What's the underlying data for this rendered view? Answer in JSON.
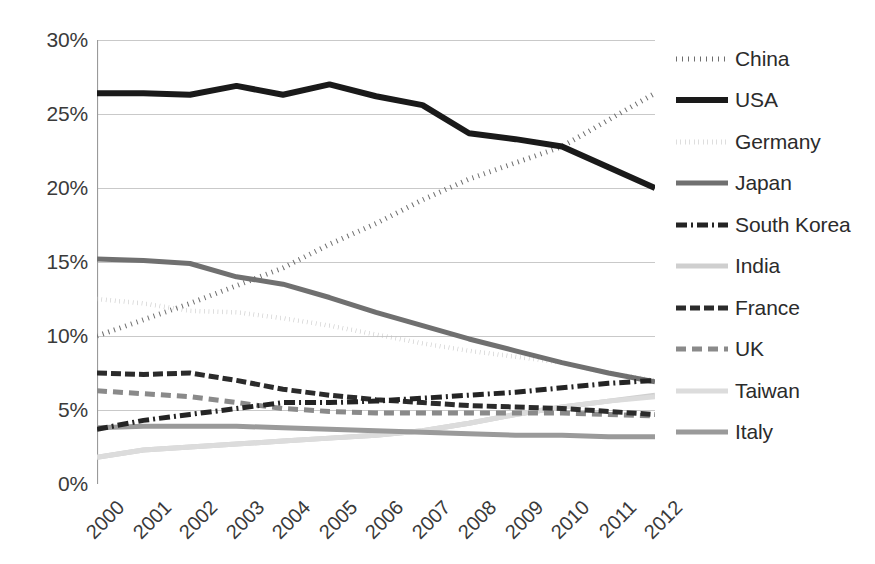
{
  "chart_data": {
    "type": "line",
    "title": "",
    "xlabel": "",
    "ylabel": "",
    "x": [
      "2000",
      "2001",
      "2002",
      "2003",
      "2004",
      "2005",
      "2006",
      "2007",
      "2008",
      "2009",
      "2010",
      "2011",
      "2012"
    ],
    "ylim": [
      0,
      30
    ],
    "ytick_labels": [
      "0%",
      "5%",
      "10%",
      "15%",
      "20%",
      "25%",
      "30%"
    ],
    "ytick_values": [
      0,
      5,
      10,
      15,
      20,
      25,
      30
    ],
    "grid": "horizontal",
    "legend_position": "right",
    "value_suffix": "%",
    "series": [
      {
        "name": "China",
        "style": "dotted",
        "color": "#6e6e6e",
        "width": 5,
        "dash": "1,5",
        "values": [
          10.0,
          11.1,
          12.2,
          13.4,
          14.6,
          16.2,
          17.6,
          19.2,
          20.6,
          21.7,
          22.8,
          24.6,
          26.4
        ]
      },
      {
        "name": "USA",
        "style": "solid",
        "color": "#1a1a1a",
        "width": 6,
        "dash": "",
        "values": [
          26.4,
          26.4,
          26.3,
          26.9,
          26.3,
          27.0,
          26.2,
          25.6,
          23.7,
          23.3,
          22.8,
          21.4,
          20.0
        ]
      },
      {
        "name": "Germany",
        "style": "dotted",
        "color": "#bdbdbd",
        "width": 4.5,
        "dash": "0.5,4",
        "values": [
          12.5,
          12.2,
          11.7,
          11.6,
          11.2,
          10.7,
          10.1,
          9.5,
          9.0,
          8.6,
          8.2,
          7.5,
          7.0
        ]
      },
      {
        "name": "Japan",
        "style": "solid",
        "color": "#707070",
        "width": 5,
        "dash": "",
        "values": [
          15.2,
          15.1,
          14.9,
          14.0,
          13.5,
          12.6,
          11.6,
          10.7,
          9.8,
          9.0,
          8.2,
          7.5,
          6.9
        ]
      },
      {
        "name": "South Korea",
        "style": "dashdot",
        "color": "#242424",
        "width": 5,
        "dash": "11,4,2,4",
        "values": [
          3.7,
          4.3,
          4.7,
          5.1,
          5.5,
          5.5,
          5.6,
          5.8,
          6.0,
          6.2,
          6.5,
          6.8,
          7.0
        ]
      },
      {
        "name": "India",
        "style": "solid",
        "color": "#cfcfcf",
        "width": 5,
        "dash": "",
        "values": [
          1.8,
          2.3,
          2.5,
          2.7,
          2.9,
          3.1,
          3.3,
          3.6,
          4.1,
          4.7,
          5.2,
          5.6,
          6.0
        ]
      },
      {
        "name": "France",
        "style": "dashed",
        "color": "#2b2b2b",
        "width": 5,
        "dash": "10,4",
        "values": [
          7.5,
          7.4,
          7.5,
          7.0,
          6.4,
          6.0,
          5.7,
          5.5,
          5.3,
          5.2,
          5.1,
          4.9,
          4.7
        ]
      },
      {
        "name": "UK",
        "style": "dashed",
        "color": "#8a8a8a",
        "width": 5,
        "dash": "10,6",
        "values": [
          6.3,
          6.1,
          5.9,
          5.5,
          5.1,
          4.9,
          4.8,
          4.8,
          4.8,
          4.8,
          4.8,
          4.7,
          4.6
        ]
      },
      {
        "name": "Taiwan",
        "style": "solid",
        "color": "#dcdcdc",
        "width": 5,
        "dash": "",
        "values": [
          1.8,
          2.3,
          2.5,
          2.7,
          2.9,
          3.1,
          3.3,
          3.6,
          4.1,
          4.7,
          5.2,
          5.6,
          5.9
        ]
      },
      {
        "name": "Italy",
        "style": "solid",
        "color": "#9a9a9a",
        "width": 5,
        "dash": "",
        "values": [
          3.8,
          3.9,
          3.9,
          3.9,
          3.8,
          3.7,
          3.6,
          3.5,
          3.4,
          3.3,
          3.3,
          3.2,
          3.2
        ]
      }
    ]
  },
  "legend": {
    "items": [
      {
        "label": "China"
      },
      {
        "label": "USA"
      },
      {
        "label": "Germany"
      },
      {
        "label": "Japan"
      },
      {
        "label": "South Korea"
      },
      {
        "label": "India"
      },
      {
        "label": "France"
      },
      {
        "label": "UK"
      },
      {
        "label": "Taiwan"
      },
      {
        "label": "Italy"
      }
    ]
  },
  "axes": {
    "y_labels": [
      "30%",
      "25%",
      "20%",
      "15%",
      "10%",
      "5%",
      "0%"
    ],
    "x_labels": [
      "2000",
      "2001",
      "2002",
      "2003",
      "2004",
      "2005",
      "2006",
      "2007",
      "2008",
      "2009",
      "2010",
      "2011",
      "2012"
    ]
  },
  "colors": {
    "gridline": "#c9c9c9",
    "axis": "#9a9a9a",
    "text": "#3a3a3a",
    "background": "#ffffff"
  }
}
